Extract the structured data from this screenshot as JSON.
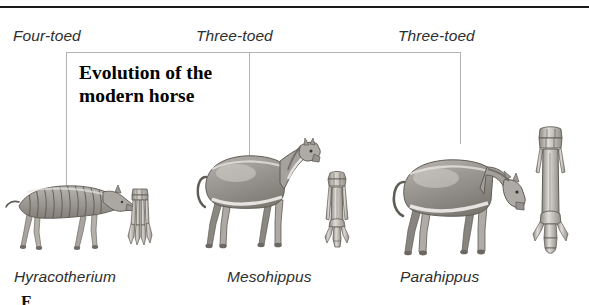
{
  "figure": {
    "title": "Evolution of the\nmodern horse",
    "title_line_1": "Evolution of the",
    "title_line_2": "modern horse",
    "caption_stub": "F",
    "top_rule_color": "#1a1a1a",
    "connector_color": "#b4b4b4",
    "text_color": "#2e2e2e",
    "background": "#ffffff"
  },
  "stages": [
    {
      "toe_label": "Four-toed",
      "genus": "Hyracotherium",
      "horse_icon": "hyracotherium-horse-illustration",
      "foot_icon": "four-toed-foot-bone-illustration"
    },
    {
      "toe_label": "Three-toed",
      "genus": "Mesohippus",
      "horse_icon": "mesohippus-horse-illustration",
      "foot_icon": "three-toed-foot-bone-illustration"
    },
    {
      "toe_label": "Three-toed",
      "genus": "Parahippus",
      "horse_icon": "parahippus-horse-illustration",
      "foot_icon": "three-toed-elongated-foot-bone-illustration"
    }
  ]
}
